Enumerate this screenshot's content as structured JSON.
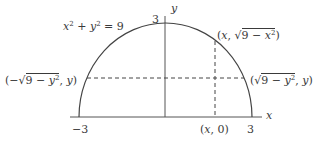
{
  "diagram": {
    "type": "semicircle-with-points",
    "equation": {
      "lhs_x": "x",
      "lhs_x_exp": "2",
      "plus": " + ",
      "lhs_y": "y",
      "lhs_y_exp": "2",
      "equals": " = ",
      "rhs": "9"
    },
    "axes": {
      "x_label": "x",
      "y_label": "y"
    },
    "ticks": {
      "x_left": "−3",
      "x_right": "3",
      "y_top": "3"
    },
    "points": {
      "top_point": {
        "open": "(",
        "x": "x",
        "comma": ", ",
        "sqrt_body_num": "9",
        "sqrt_body_minus": " − ",
        "sqrt_body_var": "x",
        "sqrt_body_exp": "2",
        "close": ")"
      },
      "left_point": {
        "open": "(−",
        "sqrt_body_num": "9",
        "sqrt_body_minus": " − ",
        "sqrt_body_var": "y",
        "sqrt_body_exp": "2",
        "comma": ", ",
        "y": "y",
        "close": ")"
      },
      "right_point": {
        "open": "(",
        "sqrt_body_num": "9",
        "sqrt_body_minus": " − ",
        "sqrt_body_var": "y",
        "sqrt_body_exp": "2",
        "comma": ", ",
        "y": "y",
        "close": ")"
      },
      "axis_point": {
        "open": "(",
        "x": "x",
        "comma": ", ",
        "zero": "0",
        "close": ")"
      }
    },
    "colors": {
      "stroke": "#444444",
      "text": "#3a3a3a",
      "background": "#ffffff"
    }
  }
}
